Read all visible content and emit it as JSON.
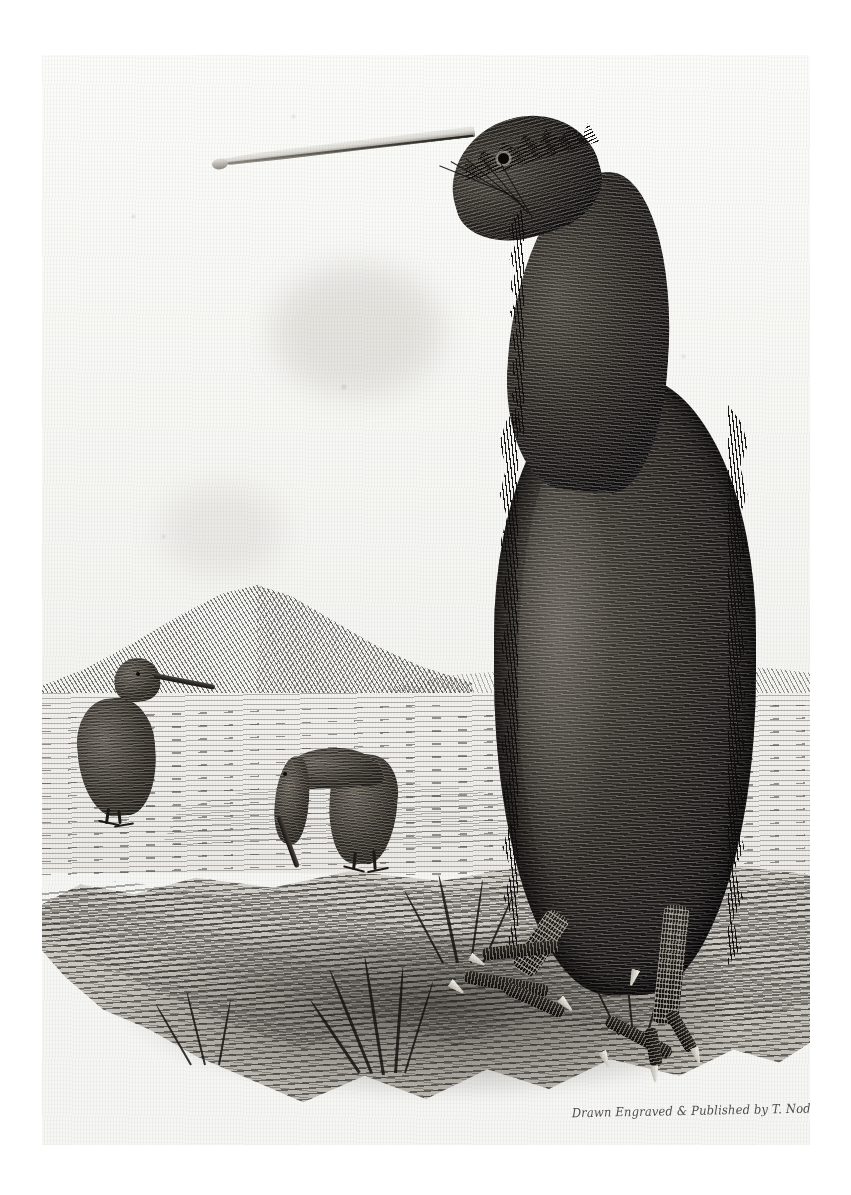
{
  "plate": {
    "title": "Apteryx (Kiwi) antique engraved plate",
    "subject": "kiwi-bird-engraving",
    "medium": "copper-plate engraving on laid paper",
    "paper_color": "#f6f6f4",
    "ink_color": "#14120f",
    "inscription": "Drawn Engraved & Published by T. Nodder."
  },
  "scene": {
    "sky_label": "blank sky",
    "horizon_label": "distant plain",
    "hill_label": "hatched hill",
    "ground_label": "foreground mound with grass tufts"
  },
  "main_bird": {
    "name": "kiwi-foreground",
    "pose": "standing upright facing left",
    "bill_label": "long slender pale bill",
    "eye_label": "eye",
    "plumage_label": "shaggy hair-like plumage",
    "legs_label": "stout scaled legs with claws"
  },
  "background_birds": [
    {
      "name": "kiwi-standing",
      "pose": "standing upright facing right"
    },
    {
      "name": "kiwi-probing",
      "pose": "bent over probing ground with bill"
    }
  ],
  "colors": {
    "paper": "#f6f6f4",
    "ink": "#14120f",
    "mid_tone": "#4a453e",
    "ground": "#b9b6ae",
    "bill_light": "#f1f0ec"
  }
}
